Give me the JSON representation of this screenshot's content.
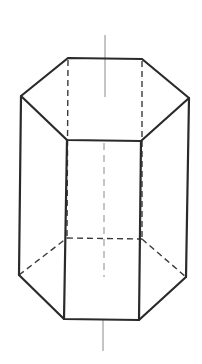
{
  "diagram": {
    "title": "",
    "colors": {
      "edge": "#2a2a2a",
      "hidden_edge": "#3a3a3a",
      "axis": "#8a8a8a",
      "background": "#ffffff"
    },
    "vertices": {
      "top": {
        "back_left": [
          68,
          58
        ],
        "back_right": [
          142,
          59
        ],
        "left": [
          21,
          96
        ],
        "right": [
          189,
          98
        ],
        "front_left": [
          67,
          140
        ],
        "front_right": [
          141,
          141
        ]
      },
      "bottom": {
        "back_left": [
          67,
          238
        ],
        "back_right": [
          142,
          239
        ],
        "left": [
          19,
          275
        ],
        "right": [
          186,
          277
        ],
        "front_left": [
          64,
          319
        ],
        "front_right": [
          139,
          320
        ]
      }
    },
    "axis": {
      "x": 105,
      "top_segment": [
        35,
        97
      ],
      "hidden_segment": [
        143,
        277
      ],
      "bottom_segment": [
        320,
        351
      ]
    }
  }
}
